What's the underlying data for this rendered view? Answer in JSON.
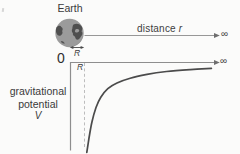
{
  "figure": {
    "earth_label": "Earth",
    "distance_label": "distance",
    "distance_symbol": "r",
    "radius_arrow_label": "R",
    "radius_tick_label": "R",
    "origin_label": "0",
    "infinity_top": "∞",
    "infinity_bottom": "∞",
    "ylabel_line1": "gravitational",
    "ylabel_line2": "potential",
    "ylabel_symbol": "V"
  },
  "colors": {
    "text": "#3b3b3b",
    "axis_line": "#8e8e8e",
    "distance_line": "#979797",
    "arrowhead": "#6e6e6e",
    "curve": "#4b4b4b",
    "dashed_guide": "#b6b6b6",
    "globe_fill": "#9b9b9b",
    "globe_land": "#4f4f4f",
    "radius_arrow": "#4a4a4a"
  },
  "chart_data": {
    "type": "line",
    "xlabel": "distance r",
    "ylabel": "gravitational potential V",
    "x_units": "Earth radii R (curve starts at planet surface r = R)",
    "x": [
      1.2,
      1.36,
      1.57,
      1.86,
      2.2,
      2.7,
      3.36,
      4.3,
      5.5,
      6.9,
      8.6,
      10.1
    ],
    "y": [
      -0.95,
      -0.8,
      -0.63,
      -0.48,
      -0.37,
      -0.28,
      -0.22,
      -0.17,
      -0.13,
      -0.1,
      -0.08,
      -0.066
    ],
    "ylim": [
      -1,
      0
    ],
    "x_axis_tick_labels": [
      "0",
      "R"
    ],
    "y_axis_top_value": 0,
    "asymptote": "V → 0 as r → ∞",
    "legend": null,
    "grid": false
  }
}
